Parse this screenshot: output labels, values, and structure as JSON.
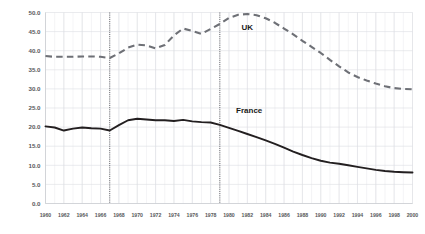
{
  "chart_data": {
    "type": "line",
    "title": "",
    "subtitle": "",
    "xlabel": "",
    "ylabel": "",
    "xlim": [
      1960,
      2000
    ],
    "ylim": [
      0.0,
      50.0
    ],
    "grid": true,
    "legend_position": "inline-annotation",
    "ytick_labels": [
      "50.0",
      "45.0",
      "40.0",
      "35.0",
      "30.0",
      "25.0",
      "20.0",
      "15.0",
      "10.0",
      "5.0",
      "0.0"
    ],
    "ytick_values": [
      50.0,
      45.0,
      40.0,
      35.0,
      30.0,
      25.0,
      20.0,
      15.0,
      10.0,
      5.0,
      0.0
    ],
    "xtick_labels": [
      "1960",
      "1962",
      "1964",
      "1966",
      "1968",
      "1970",
      "1972",
      "1974",
      "1976",
      "1978",
      "1980",
      "1982",
      "1984",
      "1986",
      "1988",
      "1990",
      "1992",
      "1994",
      "1996",
      "1998",
      "2000"
    ],
    "xtick_values": [
      1960,
      1962,
      1964,
      1966,
      1968,
      1970,
      1972,
      1974,
      1976,
      1978,
      1980,
      1982,
      1984,
      1986,
      1988,
      1990,
      1992,
      1994,
      1996,
      1998,
      2000
    ],
    "x": [
      1960,
      1961,
      1962,
      1963,
      1964,
      1965,
      1966,
      1967,
      1968,
      1969,
      1970,
      1971,
      1972,
      1973,
      1974,
      1975,
      1976,
      1977,
      1978,
      1979,
      1980,
      1981,
      1982,
      1983,
      1984,
      1985,
      1986,
      1987,
      1988,
      1989,
      1990,
      1991,
      1992,
      1993,
      1994,
      1995,
      1996,
      1997,
      1998,
      1999,
      2000
    ],
    "series": [
      {
        "name": "UK",
        "style": "dashed",
        "color": "#6e7076",
        "annotation": "UK",
        "annotation_x": 1982,
        "annotation_y": 45.5,
        "values": [
          38.6,
          38.4,
          38.4,
          38.4,
          38.5,
          38.5,
          38.4,
          38.1,
          39.3,
          40.8,
          41.6,
          41.4,
          40.6,
          41.5,
          44.0,
          45.8,
          45.2,
          44.4,
          45.7,
          47.0,
          48.6,
          49.4,
          49.6,
          49.3,
          48.5,
          47.3,
          45.8,
          44.3,
          42.6,
          41.0,
          39.4,
          37.6,
          35.9,
          34.3,
          33.1,
          32.2,
          31.4,
          30.7,
          30.2,
          30.0,
          29.9
        ]
      },
      {
        "name": "France",
        "style": "solid",
        "color": "#231f20",
        "annotation": "France",
        "annotation_x": 1982.2,
        "annotation_y": 23.8,
        "values": [
          20.2,
          19.9,
          19.1,
          19.6,
          19.9,
          19.7,
          19.6,
          19.1,
          20.5,
          21.8,
          22.2,
          22.0,
          21.8,
          21.8,
          21.6,
          21.9,
          21.5,
          21.3,
          21.2,
          20.6,
          19.8,
          19.0,
          18.2,
          17.4,
          16.5,
          15.6,
          14.6,
          13.6,
          12.7,
          11.9,
          11.2,
          10.7,
          10.4,
          10.0,
          9.6,
          9.2,
          8.8,
          8.5,
          8.3,
          8.2,
          8.1
        ]
      }
    ],
    "event_lines": [
      {
        "name": "event-line-1967",
        "x": 1967
      },
      {
        "name": "event-line-1979",
        "x": 1979
      }
    ]
  }
}
